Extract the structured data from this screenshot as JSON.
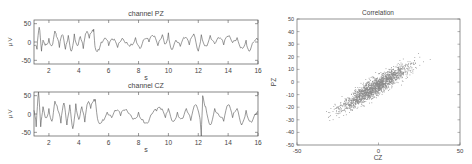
{
  "chart_data": [
    {
      "type": "line",
      "title": "channel PZ",
      "xlabel": "s",
      "ylabel": "μ V",
      "xlim": [
        1,
        16
      ],
      "ylim": [
        -60,
        60
      ],
      "xticks": [
        2,
        4,
        6,
        8,
        10,
        12,
        14,
        16
      ],
      "yticks": [
        -50,
        0,
        50
      ],
      "grid": false,
      "series": [
        {
          "name": "PZ",
          "color": "#555555",
          "x": [
            1.0,
            1.2,
            1.35,
            1.5,
            1.6,
            1.8,
            2.0,
            2.2,
            2.4,
            2.5,
            2.7,
            2.9,
            3.1,
            3.3,
            3.5,
            3.7,
            3.9,
            4.1,
            4.3,
            4.5,
            4.7,
            4.9,
            5.0,
            5.1,
            5.3,
            5.5,
            5.8,
            6.0,
            6.3,
            6.6,
            6.9,
            7.2,
            7.5,
            7.8,
            8.1,
            8.4,
            8.7,
            9.0,
            9.3,
            9.6,
            9.8,
            10.0,
            10.2,
            10.5,
            10.8,
            11.1,
            11.4,
            11.7,
            12.0,
            12.2,
            12.5,
            12.8,
            13.1,
            13.4,
            13.7,
            14.0,
            14.3,
            14.6,
            14.9,
            15.2,
            15.4,
            15.7,
            16.0
          ],
          "y": [
            -10,
            -20,
            40,
            -25,
            5,
            -5,
            10,
            -10,
            30,
            15,
            -15,
            20,
            -20,
            18,
            -25,
            22,
            -10,
            15,
            -18,
            25,
            10,
            30,
            35,
            -15,
            -20,
            0,
            10,
            -10,
            5,
            -15,
            10,
            0,
            -5,
            12,
            -18,
            8,
            0,
            15,
            -10,
            20,
            -5,
            25,
            -20,
            5,
            -12,
            10,
            -8,
            22,
            -25,
            20,
            -10,
            18,
            -5,
            10,
            -8,
            15,
            -2,
            12,
            -15,
            5,
            -25,
            0,
            5
          ]
        }
      ]
    },
    {
      "type": "line",
      "title": "channel CZ",
      "xlabel": "s",
      "ylabel": "μ V",
      "xlim": [
        1,
        16
      ],
      "ylim": [
        -60,
        60
      ],
      "xticks": [
        2,
        4,
        6,
        8,
        10,
        12,
        14,
        16
      ],
      "yticks": [
        -50,
        0,
        50
      ],
      "grid": false,
      "series": [
        {
          "name": "CZ",
          "color": "#555555",
          "x": [
            1.0,
            1.15,
            1.3,
            1.45,
            1.6,
            1.8,
            2.0,
            2.2,
            2.4,
            2.6,
            2.8,
            3.0,
            3.2,
            3.4,
            3.6,
            3.8,
            4.0,
            4.2,
            4.4,
            4.6,
            4.8,
            5.0,
            5.1,
            5.3,
            5.6,
            5.9,
            6.2,
            6.5,
            6.8,
            7.1,
            7.4,
            7.7,
            8.0,
            8.3,
            8.6,
            8.9,
            9.2,
            9.5,
            9.8,
            10.0,
            10.3,
            10.6,
            10.9,
            11.2,
            11.5,
            11.8,
            12.1,
            12.2,
            12.3,
            12.5,
            12.8,
            13.1,
            13.4,
            13.7,
            14.0,
            14.3,
            14.6,
            14.9,
            15.2,
            15.5,
            15.8,
            16.0
          ],
          "y": [
            10,
            -35,
            60,
            -35,
            20,
            -10,
            15,
            -20,
            35,
            10,
            -25,
            30,
            -30,
            25,
            -40,
            28,
            -15,
            20,
            -22,
            30,
            15,
            38,
            40,
            -20,
            -15,
            5,
            -10,
            8,
            -5,
            10,
            0,
            -12,
            5,
            -15,
            -25,
            0,
            8,
            12,
            -10,
            15,
            -20,
            5,
            -12,
            15,
            -18,
            25,
            -10,
            -60,
            50,
            20,
            -30,
            15,
            -5,
            -20,
            25,
            -10,
            15,
            -30,
            10,
            -20,
            0,
            5
          ]
        }
      ]
    },
    {
      "type": "scatter",
      "title": "Correlation",
      "xlabel": "CZ",
      "ylabel": "PZ",
      "xlim": [
        -50,
        50
      ],
      "ylim": [
        -50,
        50
      ],
      "xticks": [
        -50,
        0,
        50
      ],
      "yticks": [
        -50,
        -40,
        -30,
        -20,
        -10,
        0,
        10,
        20,
        30,
        40,
        50
      ],
      "grid": false,
      "series": [
        {
          "name": "PZ vs CZ",
          "color": "#888888",
          "description": "dense cloud of points along a positive diagonal; approx PZ ≈ 0.8·CZ, spread ±10, spanning CZ −45..45"
        }
      ]
    }
  ],
  "plots": {
    "pz": {
      "title": "channel PZ",
      "xlabel": "s",
      "ylabel": "μ V",
      "xticks": [
        "2",
        "4",
        "6",
        "8",
        "10",
        "12",
        "14",
        "16"
      ],
      "yticks": [
        "50",
        "0",
        "-50"
      ]
    },
    "cz": {
      "title": "channel CZ",
      "xlabel": "s",
      "ylabel": "μ V",
      "xticks": [
        "2",
        "4",
        "6",
        "8",
        "10",
        "12",
        "14",
        "16"
      ],
      "yticks": [
        "50",
        "0",
        "-50"
      ]
    },
    "corr": {
      "title": "Correlation",
      "xlabel": "CZ",
      "ylabel": "PZ",
      "xticks": [
        "-50",
        "0",
        "50"
      ],
      "yticks": [
        "50",
        "40",
        "30",
        "20",
        "10",
        "0",
        "-10",
        "-20",
        "-30",
        "-40",
        "-50"
      ]
    }
  }
}
